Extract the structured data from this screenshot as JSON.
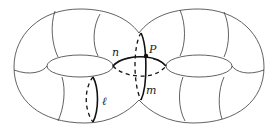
{
  "figure": {
    "labels": {
      "point": "P",
      "loop_l": "ℓ",
      "loop_m": "m",
      "loop_n": "n"
    },
    "colors": {
      "outline": "#3a3a3a",
      "loop": "#111111",
      "background": "#ffffff"
    }
  }
}
